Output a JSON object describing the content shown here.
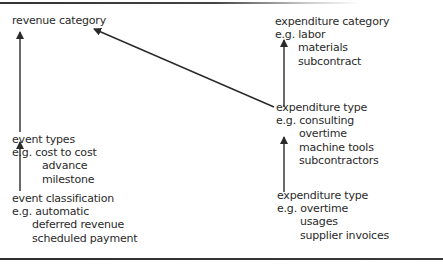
{
  "nodes": {
    "revenue_category": {
      "title": "revenue category"
    },
    "event_types": {
      "title": "event types",
      "example": "e.g. cost to cost",
      "items": [
        "advance",
        "milestone"
      ]
    },
    "event_classification": {
      "title": "event classification",
      "example": "e.g. automatic",
      "items": [
        "deferred revenue",
        "scheduled payment"
      ]
    },
    "expenditure_category": {
      "title": "expenditure category",
      "example": "e.g. labor",
      "items": [
        "materials",
        "subcontract"
      ]
    },
    "expenditure_type_1": {
      "title": "expenditure type",
      "example": "e.g. consulting",
      "items": [
        "overtime",
        "machine tools",
        "subcontractors"
      ]
    },
    "expenditure_type_2": {
      "title": "expenditure type",
      "example": "e.g. overtime",
      "items": [
        "usages",
        "supplier invoices"
      ]
    }
  },
  "edges": [
    {
      "from": "event_types",
      "to": "revenue_category"
    },
    {
      "from": "event_classification",
      "to": "event_types"
    },
    {
      "from": "expenditure_type_1",
      "to": "revenue_category"
    },
    {
      "from": "expenditure_type_1",
      "to": "expenditure_category"
    },
    {
      "from": "expenditure_type_2",
      "to": "expenditure_type_1"
    }
  ],
  "colors": {
    "line": "#2a2a2a",
    "text": "#2a2a2a",
    "background": "#ffffff"
  }
}
